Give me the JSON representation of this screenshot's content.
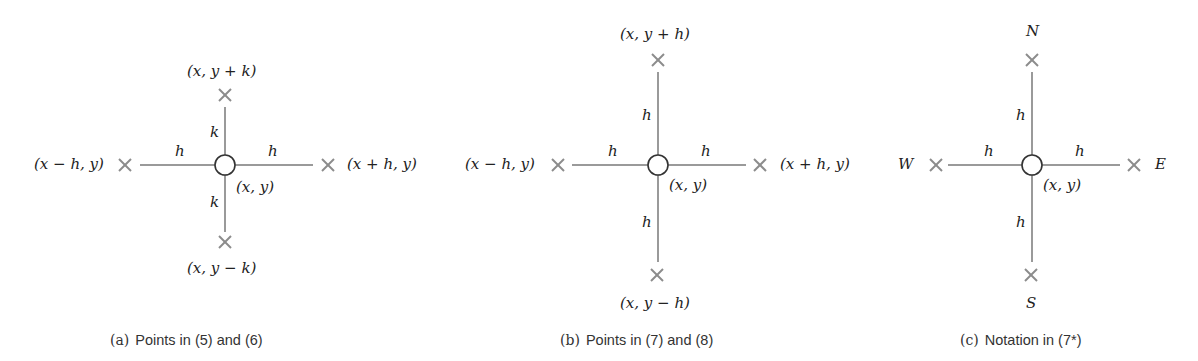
{
  "colors": {
    "line": "#9a9a9a",
    "cross": "#8c8c8c",
    "circle": "#333333",
    "text": "#222222"
  },
  "panels": [
    {
      "id": "a",
      "center": [
        225,
        165
      ],
      "center_label": "(x, y)",
      "north": {
        "label": "(x, y + k)",
        "pos": [
          225,
          95
        ]
      },
      "south": {
        "label": "(x, y − k)",
        "pos": [
          225,
          242
        ]
      },
      "west": {
        "label": "(x − h, y)",
        "pos": [
          125,
          165
        ]
      },
      "east": {
        "label": "(x + h, y)",
        "pos": [
          328,
          165
        ]
      },
      "arm_labels": {
        "north": "k",
        "south": "k",
        "west": "h",
        "east": "h"
      },
      "caption_tag": "(a)",
      "caption": "Points in (5) and (6)"
    },
    {
      "id": "b",
      "center": [
        658,
        165
      ],
      "center_label": "(x, y)",
      "north": {
        "label": "(x, y + h)",
        "pos": [
          658,
          60
        ]
      },
      "south": {
        "label": "(x, y − h)",
        "pos": [
          657,
          275
        ]
      },
      "west": {
        "label": "(x − h, y)",
        "pos": [
          558,
          165
        ]
      },
      "east": {
        "label": "(x + h, y)",
        "pos": [
          760,
          165
        ]
      },
      "arm_labels": {
        "north": "h",
        "south": "h",
        "west": "h",
        "east": "h"
      },
      "caption_tag": "(b)",
      "caption": "Points in (7) and (8)"
    },
    {
      "id": "c",
      "center": [
        1032,
        165
      ],
      "center_label": "(x, y)",
      "north": {
        "label": "N",
        "pos": [
          1032,
          60
        ]
      },
      "south": {
        "label": "S",
        "pos": [
          1031,
          275
        ]
      },
      "west": {
        "label": "W",
        "pos": [
          936,
          165
        ]
      },
      "east": {
        "label": "E",
        "pos": [
          1134,
          165
        ]
      },
      "arm_labels": {
        "north": "h",
        "south": "h",
        "west": "h",
        "east": "h"
      },
      "caption_tag": "(c)",
      "caption": "Notation in (7*)"
    }
  ]
}
